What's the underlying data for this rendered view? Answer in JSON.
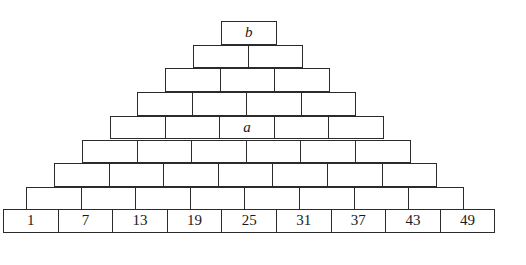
{
  "figure": {
    "name": "brick-pyramid",
    "background_color": "#ffffff",
    "stroke_color": "#2b2b2b",
    "text_color": "#1a1a1a",
    "geometry": {
      "brick_width": 55.6,
      "brick_height": 23.7,
      "left_base": 3,
      "top_base": 21,
      "row_count": 9
    },
    "rows": [
      {
        "index": 1,
        "brick_count": 1,
        "left": 221,
        "top": 21,
        "labels": [
          "b"
        ],
        "style": "italic"
      },
      {
        "index": 2,
        "brick_count": 2,
        "left": 193,
        "top": 44.7,
        "labels": [
          "",
          ""
        ],
        "style": "italic"
      },
      {
        "index": 3,
        "brick_count": 3,
        "left": 165,
        "top": 68.4,
        "labels": [
          "",
          "",
          ""
        ],
        "style": "italic"
      },
      {
        "index": 4,
        "brick_count": 4,
        "left": 137,
        "top": 92.1,
        "labels": [
          "",
          "",
          "",
          ""
        ],
        "style": "italic"
      },
      {
        "index": 5,
        "brick_count": 5,
        "left": 110,
        "top": 115.8,
        "labels": [
          "",
          "",
          "a",
          "",
          ""
        ],
        "style": "italic"
      },
      {
        "index": 6,
        "brick_count": 6,
        "left": 82,
        "top": 139.5,
        "labels": [
          "",
          "",
          "",
          "",
          "",
          ""
        ],
        "style": "italic"
      },
      {
        "index": 7,
        "brick_count": 7,
        "left": 54,
        "top": 163.2,
        "labels": [
          "",
          "",
          "",
          "",
          "",
          "",
          ""
        ],
        "style": "italic"
      },
      {
        "index": 8,
        "brick_count": 8,
        "left": 26,
        "top": 186.9,
        "labels": [
          "",
          "",
          "",
          "",
          "",
          "",
          "",
          ""
        ],
        "style": "italic"
      },
      {
        "index": 9,
        "brick_count": 9,
        "left": 3,
        "top": 208.5,
        "labels": [
          "1",
          "7",
          "13",
          "19",
          "25",
          "31",
          "37",
          "43",
          "49"
        ],
        "style": "numeric"
      }
    ]
  },
  "chart_data": {
    "type": "table",
    "title": "",
    "categories": [
      "row 1 (apex)",
      "row 2",
      "row 3",
      "row 4",
      "row 5",
      "row 6",
      "row 7",
      "row 8",
      "row 9 (base)"
    ],
    "values": [
      1,
      2,
      3,
      4,
      5,
      6,
      7,
      8,
      9
    ],
    "xlabel": "course",
    "ylabel": "number of bricks",
    "bottom_row_sequence": [
      1,
      7,
      13,
      19,
      25,
      31,
      37,
      43,
      49
    ],
    "sequence_first_term": 1,
    "sequence_common_difference": 6,
    "annotations": [
      {
        "label": "b",
        "row": 1,
        "position_in_row": 1
      },
      {
        "label": "a",
        "row": 5,
        "position_in_row": 3
      }
    ],
    "legend": [],
    "grid": false
  }
}
